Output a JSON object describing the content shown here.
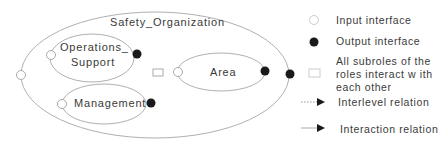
{
  "diagram": {
    "outer_role": "Safety_Organization",
    "subroles": [
      {
        "name": "Operations_\nSupport",
        "line1": "Operations_",
        "line2": "Support"
      },
      {
        "name": "Area"
      },
      {
        "name": "Management"
      }
    ]
  },
  "legend": {
    "input_interface": "Input interface",
    "output_interface": "Output interface",
    "all_subroles_line1": "All subroles of the",
    "all_subroles_line2": "roles interact w ith",
    "all_subroles_line3": "each other",
    "interlevel_relation": "Interlevel relation",
    "interaction_relation": "Interaction relation"
  },
  "colors": {
    "stroke": "#aaaaaa",
    "output_fill": "#1a1a1a"
  }
}
